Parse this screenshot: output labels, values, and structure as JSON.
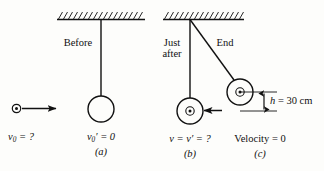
{
  "figure": {
    "background_color": "#fdfdfb",
    "ink_color": "#111111"
  },
  "panels": [
    {
      "id": "a",
      "caption": "(a)",
      "stage_label": "Before",
      "velocity_label_bullet": "v",
      "velocity_label_bullet_sub": "0",
      "velocity_label_bullet_rest": " = ?",
      "velocity_label_block": "v",
      "velocity_label_block_sub": "0",
      "velocity_label_block_rest": "′ = 0"
    },
    {
      "id": "b",
      "caption": "(b)",
      "stage_label_line1": "Just",
      "stage_label_line2": "after",
      "velocity_label": "v = v′ = ?"
    },
    {
      "id": "c",
      "caption": "(c)",
      "stage_label": "End",
      "velocity_label": "Velocity = 0",
      "height_symbol": "h",
      "height_value": " = 30 cm"
    }
  ],
  "measurements": {
    "height_label": "h = 30 cm",
    "height_value_number": "30",
    "height_units": "cm"
  },
  "icons": {
    "bullet": "bullet-icon",
    "arrow": "arrow-right-icon",
    "ceiling": "hatched-ceiling-icon",
    "pendulum_block": "pendulum-block-icon",
    "dimension": "dimension-arrow-icon"
  }
}
